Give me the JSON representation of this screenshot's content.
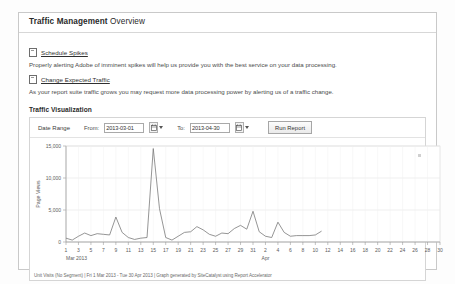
{
  "panel": {
    "title_bold": "Traffic Management",
    "title_rest": " Overview"
  },
  "links": [
    {
      "icon": "document-icon",
      "label": "Schedule Spikes",
      "description": "Properly alerting Adobe of imminent spikes will help us provide you with the best service on your data processing."
    },
    {
      "icon": "document-icon",
      "label": "Change Expected Traffic",
      "description": "As your report suite traffic grows you may request more data processing power by alerting us of a traffic change."
    }
  ],
  "visualization": {
    "section_title": "Traffic Visualization",
    "toolbar": {
      "date_range_label": "Date Range",
      "from_label": "From:",
      "from_value": "2013-03-01",
      "to_label": "To:",
      "to_value": "2013-04-30",
      "calendar_icon": "calendar-icon",
      "run_report_label": "Run Report"
    },
    "footer": "Unit Visits (No Segment) | Fri  1 Mar  2013 - Tue  30 Apr  2013 | Graph generated by SiteCatalyst using Report Accelerator"
  },
  "chart_data": {
    "type": "line",
    "title": "",
    "xlabel": "",
    "ylabel": "Page Views",
    "ylim": [
      0,
      15000
    ],
    "yticks": [
      0,
      5000,
      10000,
      15000
    ],
    "ytick_labels": [
      "0",
      "5,000",
      "10,000",
      "15,000"
    ],
    "grid": true,
    "legend": "none",
    "line_color": "#7a7a7a",
    "x_axis_month_labels": [
      "Mar 2013",
      "Apr"
    ],
    "xtick_labels_march": [
      "1",
      "3",
      "5",
      "7",
      "9",
      "11",
      "13",
      "15",
      "17",
      "19",
      "21",
      "23",
      "25",
      "27",
      "29",
      "31"
    ],
    "xtick_labels_april": [
      "2",
      "4",
      "6",
      "8",
      "10",
      "12",
      "14",
      "16",
      "18",
      "20",
      "22",
      "24",
      "26",
      "28",
      "30"
    ],
    "x": [
      "2013-03-01",
      "2013-03-02",
      "2013-03-03",
      "2013-03-04",
      "2013-03-05",
      "2013-03-06",
      "2013-03-07",
      "2013-03-08",
      "2013-03-09",
      "2013-03-10",
      "2013-03-11",
      "2013-03-12",
      "2013-03-13",
      "2013-03-14",
      "2013-03-15",
      "2013-03-16",
      "2013-03-17",
      "2013-03-18",
      "2013-03-19",
      "2013-03-20",
      "2013-03-21",
      "2013-03-22",
      "2013-03-23",
      "2013-03-24",
      "2013-03-25",
      "2013-03-26",
      "2013-03-27",
      "2013-03-28",
      "2013-03-29",
      "2013-03-30",
      "2013-03-31",
      "2013-04-01",
      "2013-04-02",
      "2013-04-03",
      "2013-04-04",
      "2013-04-05",
      "2013-04-06",
      "2013-04-07",
      "2013-04-08",
      "2013-04-09",
      "2013-04-10",
      "2013-04-11"
    ],
    "values": [
      600,
      300,
      900,
      1400,
      1000,
      1300,
      1200,
      1100,
      3900,
      1500,
      700,
      400,
      600,
      700,
      14600,
      5200,
      700,
      300,
      900,
      1500,
      1600,
      2400,
      1900,
      1200,
      900,
      1400,
      1300,
      2100,
      2600,
      2000,
      4800,
      1600,
      900,
      700,
      3100,
      1500,
      900,
      1000,
      1000,
      1000,
      1100,
      1700
    ]
  }
}
